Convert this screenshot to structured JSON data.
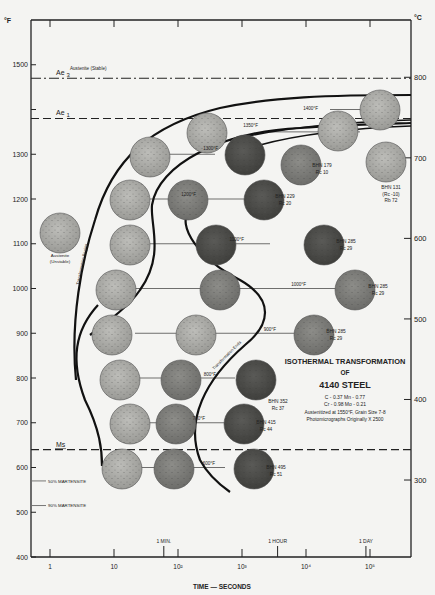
{
  "chart_data": {
    "type": "scatter",
    "title": "ISOTHERMAL TRANSFORMATION OF 4140 STEEL",
    "title_lines": [
      "ISOTHERMAL TRANSFORMATION",
      "OF",
      "4140 STEEL"
    ],
    "composition_lines": [
      "C - 0.37  Mn - 0.77",
      "Cr - 0.98  Mo - 0.21"
    ],
    "notes": [
      "Austenitized at 1550°F,  Grain Size 7-8",
      "Photomicrographs Originally X 2500"
    ],
    "xlabel": "TIME — SECONDS",
    "ylabel_left": "°F",
    "ylabel_right": "°C",
    "x_scale": "log",
    "xlim": [
      0.5,
      300000
    ],
    "ylim": [
      400,
      1600
    ],
    "x_ticks": [
      {
        "value": 1,
        "label": "1"
      },
      {
        "value": 10,
        "label": "10"
      },
      {
        "value": 100,
        "label": "10²"
      },
      {
        "value": 1000,
        "label": "10³"
      },
      {
        "value": 10000,
        "label": "10⁴"
      },
      {
        "value": 100000,
        "label": "10⁵"
      }
    ],
    "x_time_markers": [
      {
        "value": 60,
        "label": "1 MIN."
      },
      {
        "value": 3600,
        "label": "1 HOUR"
      },
      {
        "value": 86400,
        "label": "1 DAY"
      }
    ],
    "y_ticks_f": [
      1500,
      1400,
      1300,
      1200,
      1100,
      1000,
      900,
      800,
      700,
      600,
      500,
      400
    ],
    "y_tick_labels_f": [
      "1500",
      "1400",
      "1300",
      "1200",
      "1100",
      "1000",
      "900",
      "800",
      "700",
      "600",
      "500",
      "400"
    ],
    "y_ticks_c": [
      800,
      700,
      600,
      500,
      400,
      300
    ],
    "horizontal_lines": [
      {
        "name": "Ae 3",
        "temp_f": 1470,
        "style": "dash-dot"
      },
      {
        "name": "Ae 1",
        "temp_f": 1380,
        "style": "dashed"
      },
      {
        "name": "Ms",
        "temp_f": 640,
        "style": "dashed"
      }
    ],
    "region_labels": [
      {
        "text": "Austenite  (Stable)",
        "temp_f": 1510,
        "time_s": 3
      },
      {
        "text": "Austenite (Unstable)",
        "temp_f": 1140,
        "time_s": 0.6
      }
    ],
    "martensite_levels": [
      {
        "label": "50% MARTENSITE",
        "temp_f": 570
      },
      {
        "label": "90% MARTENSITE",
        "temp_f": 515
      }
    ],
    "curves": [
      {
        "name": "Transformation Begins",
        "points": [
          [
            2.4,
            880
          ],
          [
            3,
            1000
          ],
          [
            4,
            1100
          ],
          [
            6,
            1200
          ],
          [
            12,
            1300
          ],
          [
            40,
            1360
          ],
          [
            300,
            1400
          ],
          [
            3000,
            1420
          ],
          [
            300000,
            1420
          ]
        ]
      },
      {
        "name": "Transformation Ends",
        "points": [
          [
            20,
            960
          ],
          [
            40,
            1060
          ],
          [
            40,
            1160
          ],
          [
            60,
            1260
          ],
          [
            300,
            1320
          ],
          [
            3000,
            1350
          ],
          [
            300000,
            1360
          ]
        ]
      },
      {
        "name": "Transformation Ends (lower)",
        "points": [
          [
            40,
            1200
          ],
          [
            70,
            1100
          ],
          [
            400,
            1000
          ],
          [
            2000,
            1000
          ],
          [
            1000,
            900
          ],
          [
            250,
            800
          ],
          [
            250,
            700
          ],
          [
            600,
            620
          ],
          [
            1500,
            540
          ]
        ]
      },
      {
        "name": "Transformation Begins (lower)",
        "points": [
          [
            12,
            980
          ],
          [
            7,
            880
          ],
          [
            8,
            780
          ],
          [
            8,
            640
          ]
        ]
      }
    ],
    "isotherms": [
      {
        "temp_f": 1400,
        "label": "1400°F",
        "hardness": []
      },
      {
        "temp_f": 1350,
        "label": "1350°F",
        "hardness": [
          "BHN 131",
          "(Rc -10)",
          "Rb 72"
        ]
      },
      {
        "temp_f": 1300,
        "label": "1300°F",
        "hardness": [
          "BHN 179",
          "Rc 10"
        ]
      },
      {
        "temp_f": 1200,
        "label": "1200°F",
        "hardness": [
          "BHN 229",
          "Rc 20"
        ]
      },
      {
        "temp_f": 1100,
        "label": "1100°F",
        "hardness": [
          "BHN 285",
          "Rc 29"
        ]
      },
      {
        "temp_f": 1000,
        "label": "1000°F",
        "hardness": [
          "BHN 285",
          "Rc 29"
        ]
      },
      {
        "temp_f": 900,
        "label": "900°F",
        "hardness": [
          "BHN 285",
          "Rc 29"
        ]
      },
      {
        "temp_f": 800,
        "label": "800°F",
        "hardness": [
          "BHN 352",
          "Rc 37"
        ]
      },
      {
        "temp_f": 700,
        "label": "700°F",
        "hardness": [
          "BHN 415",
          "Rc 44"
        ]
      },
      {
        "temp_f": 600,
        "label": "600°F",
        "hardness": [
          "BHN 495",
          "Rc 51"
        ]
      }
    ],
    "grid": false,
    "legend": "none"
  }
}
